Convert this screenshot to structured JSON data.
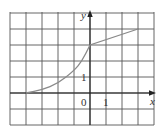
{
  "diagram": {
    "type": "function-graph",
    "grid": {
      "x_min": -5,
      "x_max": 4,
      "y_min": -2,
      "y_max": 5,
      "step": 1,
      "line_color": "#555555"
    },
    "axes": {
      "x_label": "x",
      "y_label": "y",
      "origin_label": "0",
      "x_tick_label": "1",
      "y_tick_label": "1",
      "color": "#222222"
    },
    "curve": {
      "color": "#8a8a8a",
      "pieces": [
        {
          "kind": "curve",
          "from": [
            -4,
            0
          ],
          "to": [
            0,
            3
          ],
          "points": [
            [
              -4,
              0
            ],
            [
              -3,
              0.2
            ],
            [
              -2,
              0.6
            ],
            [
              -1,
              1.4
            ],
            [
              -0.5,
              2.0
            ],
            [
              0,
              3
            ]
          ]
        },
        {
          "kind": "line",
          "from": [
            0,
            3
          ],
          "to": [
            3,
            4
          ]
        }
      ]
    }
  }
}
